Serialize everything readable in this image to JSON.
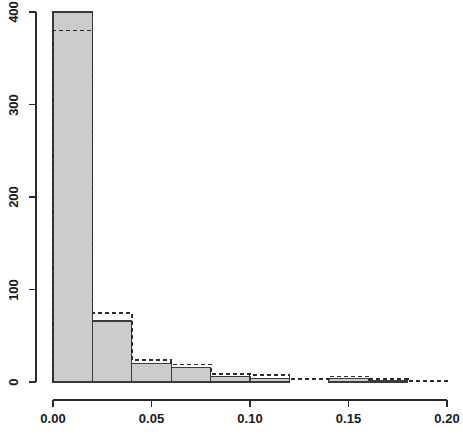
{
  "chart_data": {
    "type": "bar",
    "title": "",
    "subtitle": "",
    "xlabel": "",
    "ylabel": "",
    "grid": false,
    "legend": "none",
    "bin_width": 0.02,
    "xlim": [
      0.0,
      0.2
    ],
    "ylim": [
      0,
      400
    ],
    "xticks": [
      0.0,
      0.05,
      0.1,
      0.15,
      0.2
    ],
    "xtick_labels": [
      "0.00",
      "0.05",
      "0.10",
      "0.15",
      "0.20"
    ],
    "yticks": [
      0,
      100,
      200,
      300,
      400
    ],
    "ytick_labels": [
      "0",
      "100",
      "200",
      "300",
      "400"
    ],
    "bin_edges": [
      0.0,
      0.02,
      0.04,
      0.06,
      0.08,
      0.1,
      0.12,
      0.14,
      0.16,
      0.18,
      0.2
    ],
    "bin_centers": [
      0.01,
      0.03,
      0.05,
      0.07,
      0.09,
      0.11,
      0.13,
      0.15,
      0.17,
      0.19
    ],
    "series": [
      {
        "name": "solid-filled-histogram",
        "style": "solid",
        "fill": "#cccccc",
        "stroke": "#3a3a3a",
        "values": [
          400,
          66,
          20,
          16,
          6,
          4,
          0,
          4,
          1,
          0
        ]
      },
      {
        "name": "dashed-outline-histogram",
        "style": "dashed",
        "fill": "none",
        "stroke": "#2b2b2b",
        "values": [
          380,
          75,
          24,
          19,
          9,
          8,
          3,
          6,
          3,
          1
        ]
      }
    ]
  },
  "colors": {
    "axis": "#2b2b2b",
    "bar_fill": "#cccccc",
    "bar_stroke": "#3a3a3a",
    "dashed_stroke": "#2b2b2b",
    "background": "#ffffff",
    "text": "#1a1a1a"
  },
  "axes": {
    "x_tick_label_0": "0.00",
    "x_tick_label_1": "0.05",
    "x_tick_label_2": "0.10",
    "x_tick_label_3": "0.15",
    "x_tick_label_4": "0.20",
    "y_tick_label_0": "0",
    "y_tick_label_1": "100",
    "y_tick_label_2": "200",
    "y_tick_label_3": "300",
    "y_tick_label_4": "400"
  }
}
